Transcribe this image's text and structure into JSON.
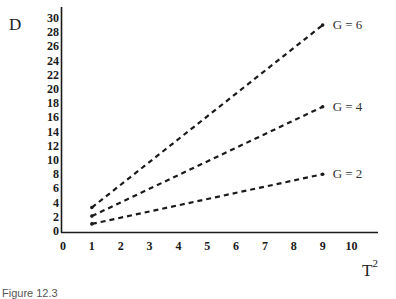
{
  "chart_data": {
    "type": "line",
    "title": "",
    "xlabel": "T",
    "xlabel_superscript": "2",
    "ylabel": "D",
    "xlim": [
      0,
      10.5
    ],
    "ylim": [
      0,
      31
    ],
    "x_ticks": [
      0,
      1,
      2,
      3,
      4,
      5,
      6,
      7,
      8,
      9,
      10
    ],
    "y_ticks": [
      0,
      2,
      4,
      6,
      8,
      10,
      12,
      14,
      16,
      18,
      20,
      22,
      24,
      26,
      28,
      30
    ],
    "grid": false,
    "legend_position": "inline-right",
    "line_style": "dashed",
    "series": [
      {
        "name": "G = 6",
        "x": [
          1,
          9
        ],
        "values": [
          3.3,
          29
        ]
      },
      {
        "name": "G = 4",
        "x": [
          1,
          9
        ],
        "values": [
          2.1,
          17.5
        ]
      },
      {
        "name": "G = 2",
        "x": [
          1,
          9
        ],
        "values": [
          1.0,
          8
        ]
      }
    ]
  },
  "caption": "Figure 12.3"
}
